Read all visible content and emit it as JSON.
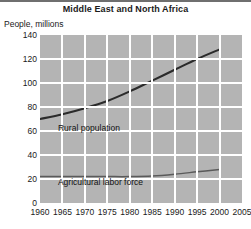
{
  "chart_data": {
    "type": "line",
    "title": "Middle East and North Africa",
    "ylabel": "People, millions",
    "xlabel": "",
    "xlim": [
      1960,
      2005
    ],
    "ylim": [
      0,
      140
    ],
    "yticks": [
      0,
      20,
      40,
      60,
      80,
      100,
      120,
      140
    ],
    "xticks": [
      1960,
      1965,
      1970,
      1975,
      1980,
      1985,
      1990,
      1995,
      2000,
      2005
    ],
    "grid": true,
    "legend_position": "inline-annotations",
    "x": [
      1960,
      1965,
      1970,
      1975,
      1980,
      1985,
      1990,
      1995,
      2000
    ],
    "series": [
      {
        "name": "Rural population",
        "color": "#2b2b2b",
        "values": [
          70,
          74,
          79,
          85,
          93,
          102,
          111,
          120,
          128
        ]
      },
      {
        "name": "Agricultural labor force",
        "color": "#5a5a5a",
        "values": [
          22,
          22,
          22,
          22,
          22,
          22.5,
          24,
          26,
          28
        ]
      }
    ],
    "annotations": [
      {
        "text": "Rural population",
        "x": 1964,
        "y": 62
      },
      {
        "text": "Agricultural labor force",
        "x": 1964,
        "y": 17
      }
    ]
  },
  "colors": {
    "plot_background": "#b4b4b4",
    "gridlines": "#ffffff",
    "top_rule": "#6f6f6f",
    "text": "#1a1a1a"
  }
}
